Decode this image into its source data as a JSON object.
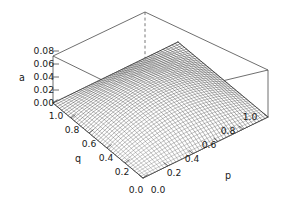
{
  "figure": {
    "kind": "3d-surface-plot",
    "background_color": "#ffffff",
    "frame_color": "#4a4a4a",
    "mesh_color_dark": "#141414",
    "mesh_color_light": "#9a9a9a"
  },
  "axes": {
    "z": {
      "title": "a",
      "ticks": [
        "0.08",
        "0.06",
        "0.04",
        "0.02",
        "0.00"
      ],
      "values": [
        0.08,
        0.06,
        0.04,
        0.02,
        0.0
      ],
      "range": [
        0.0,
        0.08
      ]
    },
    "q": {
      "title": "q",
      "ticks": [
        "1.0",
        "0.8",
        "0.6",
        "0.4",
        "0.2",
        "0.0"
      ],
      "values": [
        1.0,
        0.8,
        0.6,
        0.4,
        0.2,
        0.0
      ],
      "range": [
        0.0,
        1.0
      ]
    },
    "p": {
      "title": "p",
      "ticks": [
        "0.0",
        "0.2",
        "0.4",
        "0.6",
        "0.8",
        "1.0"
      ],
      "values": [
        0.0,
        0.2,
        0.4,
        0.6,
        0.8,
        1.0
      ],
      "range": [
        0.0,
        1.0
      ]
    }
  },
  "chart_data": {
    "type": "surface",
    "title": "",
    "xlabel": "p",
    "ylabel": "q",
    "zlabel": "a",
    "xlim": [
      0.0,
      1.0
    ],
    "ylim": [
      0.0,
      1.0
    ],
    "zlim": [
      0.0,
      0.08
    ],
    "grid": false,
    "legend": "none",
    "x": [
      0.0,
      0.1,
      0.2,
      0.3,
      0.4,
      0.5,
      0.6,
      0.7,
      0.8,
      0.9,
      1.0
    ],
    "y": [
      0.0,
      0.1,
      0.2,
      0.3,
      0.4,
      0.5,
      0.6,
      0.7,
      0.8,
      0.9,
      1.0
    ],
    "z": [
      [
        0.0,
        0.0,
        0.0,
        0.0,
        0.0,
        0.0,
        0.0,
        0.0,
        0.0,
        0.0,
        0.0
      ],
      [
        0.0,
        0.0032,
        0.0058,
        0.0076,
        0.0086,
        0.009,
        0.0086,
        0.0076,
        0.0058,
        0.0032,
        0.0
      ],
      [
        0.0,
        0.0058,
        0.0102,
        0.0134,
        0.0154,
        0.016,
        0.0154,
        0.0134,
        0.0102,
        0.0058,
        0.0
      ],
      [
        0.0,
        0.0076,
        0.0134,
        0.0176,
        0.0202,
        0.021,
        0.0202,
        0.0176,
        0.0134,
        0.0076,
        0.0
      ],
      [
        0.0,
        0.0086,
        0.0154,
        0.0202,
        0.023,
        0.024,
        0.023,
        0.0202,
        0.0154,
        0.0086,
        0.0
      ],
      [
        0.0,
        0.009,
        0.016,
        0.021,
        0.024,
        0.025,
        0.024,
        0.021,
        0.016,
        0.009,
        0.0
      ],
      [
        0.0,
        0.0086,
        0.0154,
        0.0202,
        0.023,
        0.024,
        0.023,
        0.0202,
        0.0154,
        0.0086,
        0.0
      ],
      [
        0.0,
        0.0076,
        0.0134,
        0.0176,
        0.0202,
        0.021,
        0.0202,
        0.0176,
        0.0134,
        0.0076,
        0.0
      ],
      [
        0.0,
        0.0058,
        0.0102,
        0.0134,
        0.0154,
        0.016,
        0.0154,
        0.0134,
        0.0102,
        0.0058,
        0.0
      ],
      [
        0.0,
        0.0032,
        0.0058,
        0.0076,
        0.0086,
        0.009,
        0.0086,
        0.0076,
        0.0058,
        0.0032,
        0.0
      ],
      [
        0.0,
        0.0,
        0.0,
        0.0,
        0.0,
        0.0,
        0.0,
        0.0,
        0.0,
        0.0,
        0.0
      ]
    ],
    "annotations": [
      {
        "text": "0.0",
        "role": "q-origin-tick"
      },
      {
        "text": "0.0",
        "role": "p-origin-tick"
      }
    ]
  },
  "geometry": {
    "z_tick_pixels": [
      {
        "label": "0.08",
        "x": 54,
        "y": 51
      },
      {
        "label": "0.06",
        "x": 54,
        "y": 64
      },
      {
        "label": "0.04",
        "x": 54,
        "y": 77
      },
      {
        "label": "0.02",
        "x": 54,
        "y": 90
      },
      {
        "label": "0.00",
        "x": 54,
        "y": 103
      }
    ],
    "q_tick_pixels": [
      {
        "label": "1.0",
        "x": 56,
        "y": 116
      },
      {
        "label": "0.8",
        "x": 72,
        "y": 130
      },
      {
        "label": "0.6",
        "x": 89,
        "y": 144
      },
      {
        "label": "0.4",
        "x": 106,
        "y": 158
      },
      {
        "label": "0.2",
        "x": 122,
        "y": 172
      },
      {
        "label": "0.0",
        "x": 136,
        "y": 190
      }
    ],
    "p_tick_pixels": [
      {
        "label": "0.0",
        "x": 158,
        "y": 190
      },
      {
        "label": "0.2",
        "x": 174,
        "y": 173
      },
      {
        "label": "0.4",
        "x": 192,
        "y": 159
      },
      {
        "label": "0.6",
        "x": 209,
        "y": 145
      },
      {
        "label": "0.8",
        "x": 228,
        "y": 131
      },
      {
        "label": "1.0",
        "x": 250,
        "y": 117
      }
    ],
    "axis_title_pixels": [
      {
        "label": "a",
        "x": 22,
        "y": 78
      },
      {
        "label": "q",
        "x": 78,
        "y": 159
      },
      {
        "label": "p",
        "x": 228,
        "y": 176
      }
    ]
  }
}
